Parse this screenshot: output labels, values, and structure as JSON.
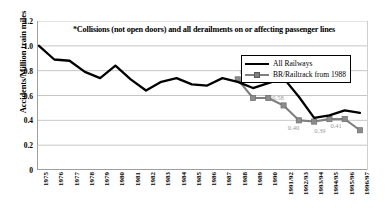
{
  "chart_data": {
    "type": "line",
    "title": "*Collisions (not open doors) and all derailments on or affecting passenger lines",
    "xlabel": "",
    "ylabel": "Accidents/Million train miles",
    "ylim": [
      0,
      1.2
    ],
    "yticks": [
      "0",
      "0.2",
      "0.4",
      "0.6",
      "0.8",
      "1.0",
      "1.2"
    ],
    "ytick_values": [
      0,
      0.2,
      0.4,
      0.6,
      0.8,
      1.0,
      1.2
    ],
    "grid": true,
    "legend_position": "upper right",
    "categories": [
      "1975",
      "1976",
      "1977",
      "1978",
      "1979",
      "1980",
      "1981",
      "1982",
      "1983",
      "1984",
      "1985",
      "1986",
      "1987",
      "1988",
      "1989",
      "1990",
      "1991/92",
      "1992/93",
      "1993/94",
      "1994/95",
      "1995/96",
      "1996/97"
    ],
    "series": [
      {
        "name": "All Railways",
        "color": "#000000",
        "values": [
          1.0,
          0.89,
          0.88,
          0.79,
          0.74,
          0.84,
          0.73,
          0.64,
          0.71,
          0.74,
          0.69,
          0.68,
          0.74,
          0.71,
          0.66,
          0.7,
          0.74,
          0.59,
          0.42,
          0.44,
          0.48,
          0.46
        ]
      },
      {
        "name": "BR/Railtrack from 1988",
        "color": "#808080",
        "values": [
          null,
          null,
          null,
          null,
          null,
          null,
          null,
          null,
          null,
          null,
          null,
          null,
          null,
          0.73,
          0.58,
          0.58,
          0.52,
          0.4,
          0.39,
          0.41,
          0.41,
          0.32
        ]
      }
    ],
    "point_labels": [
      {
        "text": "0.73",
        "series": "BR/Railtrack from 1988",
        "category": "1988",
        "value": 0.73
      },
      {
        "text": "0.58",
        "series": "BR/Railtrack from 1988",
        "category": "1990",
        "value": 0.58
      },
      {
        "text": "0.40",
        "series": "BR/Railtrack from 1988",
        "category": "1992/93",
        "value": 0.4
      },
      {
        "text": "0.39",
        "series": "BR/Railtrack from 1988",
        "category": "1993/94",
        "value": 0.39
      },
      {
        "text": "0.41",
        "series": "BR/Railtrack from 1988",
        "category": "1994/95",
        "value": 0.41
      }
    ]
  }
}
